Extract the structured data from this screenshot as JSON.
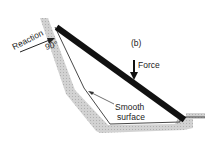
{
  "diagram": {
    "panel_label": "(b)",
    "labels": {
      "reaction": "Reaction",
      "angle": "90°",
      "force": "Force",
      "smooth_line1": "Smooth",
      "smooth_line2": "surface"
    },
    "colors": {
      "wall_hatch": "#c8c8c8",
      "beam": "#111111",
      "outline": "#333333",
      "text": "#222222"
    }
  }
}
